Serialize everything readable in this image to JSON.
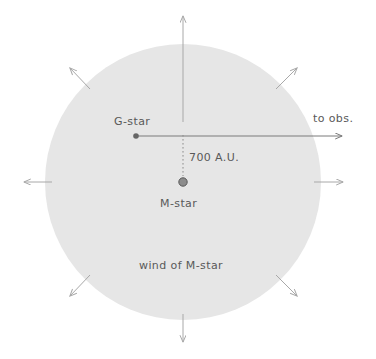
{
  "figure": {
    "type": "schematic-diagram",
    "background_color": "#ffffff"
  },
  "wind_region": {
    "name": "wind of M-star",
    "shape": "circle",
    "center_x": 183,
    "center_y": 182,
    "radius": 138,
    "fill_color": "#e6e6e6",
    "label": "wind of M-star",
    "label_x": 183,
    "label_y": 265
  },
  "stars": [
    {
      "id": "g-star",
      "label": "G-star",
      "x": 136,
      "y": 136,
      "radius": 2.8,
      "color": "#666666",
      "label_x": 136,
      "label_y": 121
    },
    {
      "id": "m-star",
      "label": "M-star",
      "x": 183,
      "y": 182,
      "radius": 4.6,
      "color": "#8c8c8c",
      "stroke_color": "#5a5a5a",
      "label_x": 183,
      "label_y": 203
    }
  ],
  "separation": {
    "label": "700 A.U.",
    "value": 700,
    "unit": "A.U.",
    "from": "g-star",
    "to": "m-star",
    "line_style": "dotted",
    "line_x": 183,
    "line_y1": 136,
    "line_y2": 177,
    "label_x": 189,
    "label_y": 158
  },
  "sightline": {
    "label": "to obs.",
    "from_x": 136,
    "from_y": 136,
    "to_x": 345,
    "to_y": 136,
    "color": "#7a7a7a",
    "label_x": 335,
    "label_y": 119
  },
  "wind_arrows": {
    "color": "#a8a8a8",
    "count": 8,
    "directions": [
      {
        "name": "north",
        "angle_deg": 270,
        "tip_x": 183,
        "tip_y": 13
      },
      {
        "name": "northeast",
        "angle_deg": 315,
        "tip_x": 300,
        "tip_y": 66
      },
      {
        "name": "east",
        "angle_deg": 0,
        "tip_x": 346,
        "tip_y": 182
      },
      {
        "name": "southeast",
        "angle_deg": 45,
        "tip_x": 300,
        "tip_y": 299
      },
      {
        "name": "south",
        "angle_deg": 90,
        "tip_x": 183,
        "tip_y": 345
      },
      {
        "name": "southwest",
        "angle_deg": 135,
        "tip_x": 67,
        "tip_y": 299
      },
      {
        "name": "west",
        "angle_deg": 180,
        "tip_x": 21,
        "tip_y": 182
      },
      {
        "name": "northwest",
        "angle_deg": 225,
        "tip_x": 67,
        "tip_y": 66
      }
    ]
  },
  "colors": {
    "wind_fill": "#e6e6e6",
    "arrow_gray": "#a8a8a8",
    "text_gray": "#595959",
    "line_gray": "#7a7a7a"
  }
}
